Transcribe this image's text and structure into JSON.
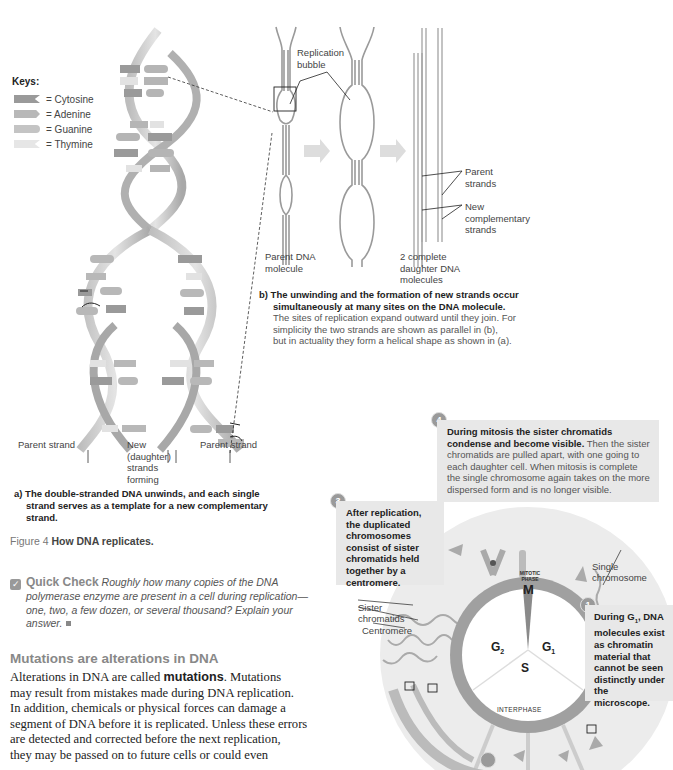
{
  "figure": {
    "number": "Figure 4",
    "title": "How DNA replicates."
  },
  "keys": {
    "title": "Keys:",
    "items": [
      {
        "label": "= Cytosine",
        "color": "#9a9a9a",
        "shape": "notch"
      },
      {
        "label": "= Adenine",
        "color": "#b8b8b8",
        "shape": "point"
      },
      {
        "label": "= Guanine",
        "color": "#c4c4c4",
        "shape": "round"
      },
      {
        "label": "= Thymine",
        "color": "#e6e6e6",
        "shape": "notch"
      }
    ]
  },
  "panel_a": {
    "labels": {
      "parent_strand_left": "Parent strand",
      "new_daughter": "New\n(daughter)\nstrands\nforming",
      "parent_strand_right": "Parent strand"
    },
    "caption_bold_1": "a) The double-stranded DNA unwinds, and each single",
    "caption_bold_2": "strand serves as a template for a new complementary",
    "caption_bold_3": "strand.",
    "base_pairs_top": [
      "C-G",
      "T-A",
      "C-G",
      "A-T",
      "G-C",
      "C-G",
      "T-A",
      "A-T"
    ]
  },
  "panel_b": {
    "labels": {
      "replication_bubble": "Replication\nbubble",
      "parent_dna": "Parent DNA\nmolecule",
      "daughter_dna": "2 complete\ndaughter DNA\nmolecules",
      "parent_strands": "Parent\nstrands",
      "new_strands": "New\ncomplementary\nstrands"
    },
    "caption_bold_1": "b) The unwinding and the formation of new strands occur",
    "caption_bold_2": "simultaneously at many sites on the DNA molecule.",
    "caption_line_1": "The sites of replication expand outward until they join. For",
    "caption_line_2": "simplicity the two strands are shown as parallel in (b),",
    "caption_line_3": "but in actuality they form a helical shape as shown in (a)."
  },
  "quick_check": {
    "icon": "check-box-icon",
    "label": "Quick Check",
    "line_1": "Roughly how many copies of the DNA",
    "line_2": "polymerase enzyme are present in a cell during replication—",
    "line_3": "one, two, a few dozen, or several thousand? Explain your",
    "line_4": "answer."
  },
  "section": {
    "heading": "Mutations are alterations in DNA",
    "p_start": "Alterations in DNA are called ",
    "p_bold": "mutations",
    "p_rest_1": ". Mutations",
    "lines": [
      "may result from mistakes made during DNA replication.",
      "In addition, chemicals or physical forces can damage a",
      "segment of DNA before it is replicated. Unless these errors",
      "are detected and corrected before the next replication,",
      "they may be passed on to future cells or could even"
    ]
  },
  "cell_cycle": {
    "phases": {
      "mitotic_small": "MITOTIC\nPHASE",
      "m": "M",
      "g1": "G",
      "g1_sub": "1",
      "g2": "G",
      "g2_sub": "2",
      "s": "S",
      "interphase": "INTERPHASE"
    },
    "labels": {
      "sister_chromatids": "Sister\nchromatids",
      "centromere": "Centromere",
      "single_chromosome": "Single\nchromosome"
    },
    "steps": [
      {
        "num": "1",
        "bold_a": "During G",
        "bold_sub": "1",
        "bold_b": ", DNA molecules exist as chromatin material that cannot be seen distinctly under the microscope.",
        "text": ""
      },
      {
        "num": "3",
        "bold_a": "After replication, the duplicated chromosomes consist of sister chromatids held together by a centromere.",
        "text": ""
      },
      {
        "num": "4",
        "bold_a": "During mitosis the sister chromatids condense and become visible.",
        "text": " Then the sister chromatids are pulled apart, with one going to each daughter cell. When mitosis is complete the single chromosome again takes on the more dispersed form and is no longer visible."
      }
    ],
    "colors": {
      "cell_bg": "#ececec",
      "ring": "#9c9c9c",
      "callout_bg": "#e8e8e8"
    }
  }
}
